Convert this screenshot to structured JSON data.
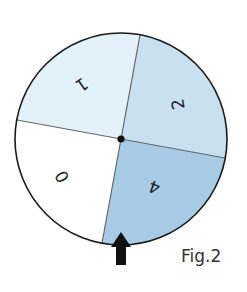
{
  "figure": {
    "caption": "Fig.2",
    "type": "spinner"
  },
  "spinner": {
    "center": {
      "x": 121,
      "y": 139
    },
    "radius": 106,
    "outline_color": "#1a1a1a",
    "divider_color": "#666666",
    "pointer": {
      "direction": "up",
      "color": "#111111"
    },
    "segments": [
      {
        "label": "1",
        "color": "#e3f1fa",
        "position": "top-left"
      },
      {
        "label": "2",
        "color": "#c9e0f0",
        "position": "top-right"
      },
      {
        "label": "4",
        "color": "#a9cce6",
        "position": "bottom-right"
      },
      {
        "label": "0",
        "color": "#ffffff",
        "position": "bottom-left"
      }
    ]
  }
}
